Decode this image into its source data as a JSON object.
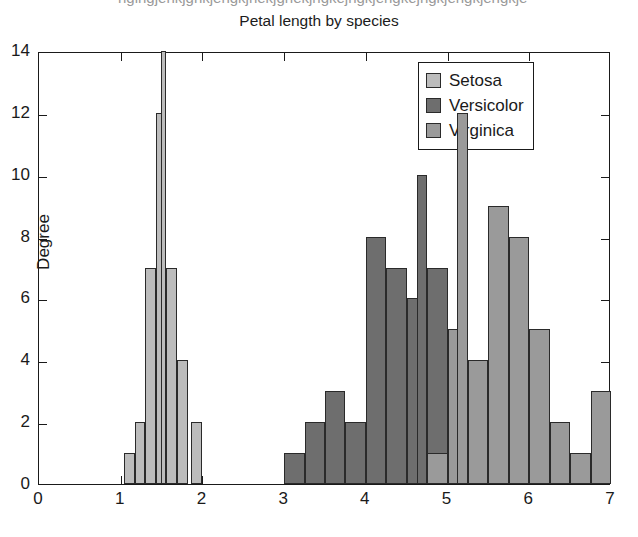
{
  "top_cut_text": "hgihgjehkjghkjehgkjhekjghekjhgkejhgkjehgkejhgkjehgkjehgkje",
  "chart_data": {
    "type": "bar",
    "title": "Petal length by species",
    "xlabel": "",
    "ylabel": "Degree",
    "xlim": [
      0,
      7
    ],
    "ylim": [
      0,
      14
    ],
    "xticks": [
      0,
      1,
      2,
      3,
      4,
      5,
      6,
      7
    ],
    "yticks": [
      0,
      2,
      4,
      6,
      8,
      10,
      12,
      14
    ],
    "grid": false,
    "legend_position": "top-right",
    "legend": [
      "Setosa",
      "Versicolor",
      "Virginica"
    ],
    "colors": {
      "setosa": "#bcbcbc",
      "versicolor": "#6e6e6e",
      "virginica": "#9a9a9a",
      "bar_edge": "#2a2a2a",
      "axis": "#1a1a1a",
      "background": "#ffffff"
    },
    "bin_width": 0.12,
    "series": [
      {
        "name": "Setosa",
        "color": "#bcbcbc",
        "bins": [
          {
            "x": 1.04,
            "w": 0.13,
            "v": 1
          },
          {
            "x": 1.17,
            "w": 0.13,
            "v": 2
          },
          {
            "x": 1.3,
            "w": 0.13,
            "v": 7
          },
          {
            "x": 1.43,
            "w": 0.13,
            "v": 12
          },
          {
            "x": 1.49,
            "w": 0.07,
            "v": 14
          },
          {
            "x": 1.56,
            "w": 0.13,
            "v": 7
          },
          {
            "x": 1.69,
            "w": 0.13,
            "v": 4
          },
          {
            "x": 1.86,
            "w": 0.13,
            "v": 2
          }
        ]
      },
      {
        "name": "Versicolor",
        "color": "#6e6e6e",
        "bins": [
          {
            "x": 3.0,
            "w": 0.25,
            "v": 1
          },
          {
            "x": 3.25,
            "w": 0.25,
            "v": 2
          },
          {
            "x": 3.5,
            "w": 0.25,
            "v": 3
          },
          {
            "x": 3.75,
            "w": 0.25,
            "v": 2
          },
          {
            "x": 4.0,
            "w": 0.25,
            "v": 8
          },
          {
            "x": 4.25,
            "w": 0.25,
            "v": 7
          },
          {
            "x": 4.5,
            "w": 0.25,
            "v": 6
          },
          {
            "x": 4.62,
            "w": 0.13,
            "v": 10
          },
          {
            "x": 4.75,
            "w": 0.25,
            "v": 7
          },
          {
            "x": 5.0,
            "w": 0.25,
            "v": 4
          }
        ]
      },
      {
        "name": "Virginica",
        "color": "#9a9a9a",
        "bins": [
          {
            "x": 4.75,
            "w": 0.25,
            "v": 1
          },
          {
            "x": 5.0,
            "w": 0.25,
            "v": 5
          },
          {
            "x": 5.12,
            "w": 0.13,
            "v": 12
          },
          {
            "x": 5.25,
            "w": 0.25,
            "v": 4
          },
          {
            "x": 5.5,
            "w": 0.25,
            "v": 9
          },
          {
            "x": 5.75,
            "w": 0.25,
            "v": 8
          },
          {
            "x": 6.0,
            "w": 0.25,
            "v": 5
          },
          {
            "x": 6.25,
            "w": 0.25,
            "v": 2
          },
          {
            "x": 6.5,
            "w": 0.25,
            "v": 1
          },
          {
            "x": 6.75,
            "w": 0.25,
            "v": 3
          }
        ]
      }
    ]
  }
}
